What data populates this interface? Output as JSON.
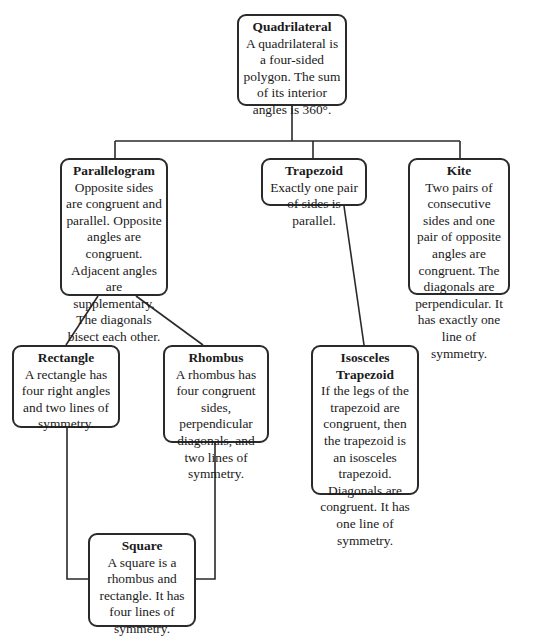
{
  "diagram": {
    "type": "hierarchy",
    "nodes": {
      "quadrilateral": {
        "title": "Quadrilateral",
        "desc": "A quadrilateral is a four-sided polygon. The sum of its interior angles is 360°."
      },
      "parallelogram": {
        "title": "Parallelogram",
        "desc": "Opposite sides are congruent and parallel. Opposite angles are congruent. Adjacent angles are supplementary. The diagonals bisect each other."
      },
      "trapezoid": {
        "title": "Trapezoid",
        "desc": "Exactly one pair of sides is parallel."
      },
      "kite": {
        "title": "Kite",
        "desc": "Two pairs of consecutive sides and one pair of opposite angles are congruent. The diagonals are perpendicular. It has exactly one line of symmetry."
      },
      "rectangle": {
        "title": "Rectangle",
        "desc": "A rectangle has four right angles and two lines of symmetry."
      },
      "rhombus": {
        "title": "Rhombus",
        "desc": "A rhombus has four congruent sides, perpendicular diagonals, and two lines of symmetry."
      },
      "isosceles_trapezoid": {
        "title": "Isosceles Trapezoid",
        "desc": "If the legs of the trapezoid are congruent, then the trapezoid is an isosceles trapezoid. Diagonals are congruent. It has one line of symmetry."
      },
      "square": {
        "title": "Square",
        "desc": "A square is a rhombus and rectangle. It has four lines of symmetry."
      }
    },
    "edges": [
      [
        "quadrilateral",
        "parallelogram"
      ],
      [
        "quadrilateral",
        "trapezoid"
      ],
      [
        "quadrilateral",
        "kite"
      ],
      [
        "parallelogram",
        "rectangle"
      ],
      [
        "parallelogram",
        "rhombus"
      ],
      [
        "trapezoid",
        "isosceles_trapezoid"
      ],
      [
        "rectangle",
        "square"
      ],
      [
        "rhombus",
        "square"
      ]
    ]
  }
}
